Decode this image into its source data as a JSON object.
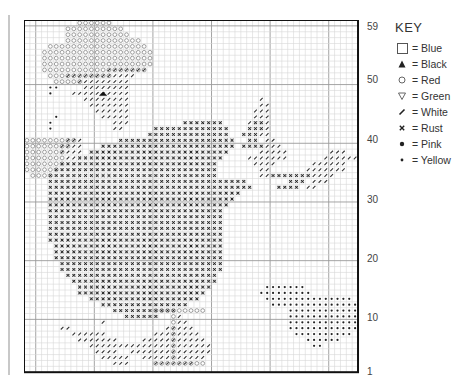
{
  "key": {
    "title": "KEY",
    "items": [
      {
        "symbol": "blue-square-icon",
        "sym": "square",
        "label": "= Blue"
      },
      {
        "symbol": "black-triangle-icon",
        "sym": "tri",
        "label": "= Black"
      },
      {
        "symbol": "red-circle-icon",
        "sym": "circle",
        "label": "= Red"
      },
      {
        "symbol": "green-down-triangle-icon",
        "sym": "vtri",
        "label": "= Green"
      },
      {
        "symbol": "white-slash-icon",
        "sym": "slash",
        "label": "= White"
      },
      {
        "symbol": "rust-x-icon",
        "sym": "x",
        "label": "= Rust"
      },
      {
        "symbol": "pink-dot-icon",
        "sym": "dot",
        "label": "= Pink"
      },
      {
        "symbol": "yellow-small-dot-icon",
        "sym": "sdot",
        "label": "= Yellow"
      }
    ]
  },
  "row_labels": [
    {
      "label": "59",
      "y": 27
    },
    {
      "label": "50",
      "y": 80
    },
    {
      "label": "40",
      "y": 140
    },
    {
      "label": "30",
      "y": 200
    },
    {
      "label": "20",
      "y": 259
    },
    {
      "label": "10",
      "y": 318
    },
    {
      "label": "1",
      "y": 372
    }
  ],
  "grid": {
    "cols": 57,
    "rows": 60,
    "cell_w": 5.86,
    "cell_h": 5.87,
    "major_every": 10,
    "major_offset_col": 2,
    "major_offset_row": 1
  },
  "chart_data": {
    "type": "table",
    "legend": [
      "Blue",
      "Black",
      "Red",
      "Green",
      "White",
      "Rust",
      "Pink",
      "Yellow"
    ],
    "row_range": [
      1,
      59
    ],
    "regions": {
      "red": [
        [
          0,
          9,
          14
        ],
        [
          1,
          7,
          16
        ],
        [
          2,
          7,
          17
        ],
        [
          3,
          7,
          19
        ],
        [
          4,
          4,
          20
        ],
        [
          5,
          3,
          21
        ],
        [
          6,
          3,
          21
        ],
        [
          7,
          3,
          21
        ],
        [
          8,
          3,
          20
        ],
        [
          9,
          4,
          14
        ],
        [
          10,
          5,
          9
        ],
        [
          20,
          0,
          8
        ],
        [
          21,
          0,
          7
        ],
        [
          22,
          0,
          6
        ],
        [
          23,
          0,
          6
        ],
        [
          24,
          0,
          6
        ],
        [
          25,
          0,
          5
        ],
        [
          26,
          1,
          4
        ]
      ],
      "white": [
        [
          8,
          14,
          20
        ],
        [
          9,
          7,
          18
        ],
        [
          10,
          9,
          17
        ],
        [
          11,
          10,
          17
        ],
        [
          12,
          8,
          17
        ],
        [
          13,
          10,
          17
        ],
        [
          14,
          11,
          17
        ],
        [
          15,
          12,
          17
        ],
        [
          16,
          13,
          17
        ],
        [
          17,
          15,
          17
        ],
        [
          18,
          15,
          16
        ],
        [
          13,
          40,
          40
        ],
        [
          14,
          40,
          41
        ],
        [
          15,
          39,
          41
        ],
        [
          16,
          39,
          41
        ],
        [
          17,
          38,
          41
        ],
        [
          18,
          38,
          41
        ],
        [
          19,
          38,
          41
        ],
        [
          20,
          41,
          42
        ],
        [
          21,
          41,
          43
        ],
        [
          22,
          40,
          44
        ],
        [
          23,
          38,
          44
        ],
        [
          24,
          39,
          42
        ],
        [
          25,
          40,
          41
        ],
        [
          26,
          40,
          41
        ],
        [
          22,
          52,
          54
        ],
        [
          23,
          51,
          56
        ],
        [
          24,
          49,
          54
        ],
        [
          25,
          48,
          54
        ],
        [
          26,
          48,
          52
        ],
        [
          27,
          49,
          51
        ],
        [
          28,
          48,
          49
        ],
        [
          20,
          7,
          9
        ],
        [
          21,
          6,
          9
        ],
        [
          22,
          6,
          9
        ],
        [
          23,
          7,
          9
        ],
        [
          24,
          8,
          9
        ],
        [
          25,
          8,
          10
        ],
        [
          26,
          7,
          10
        ],
        [
          27,
          7,
          11
        ],
        [
          28,
          8,
          12
        ]
      ],
      "rust": [
        [
          17,
          27,
          33
        ],
        [
          18,
          22,
          34
        ],
        [
          19,
          21,
          34
        ],
        [
          20,
          16,
          35
        ],
        [
          21,
          13,
          35
        ],
        [
          22,
          11,
          34
        ],
        [
          23,
          9,
          33
        ],
        [
          24,
          6,
          32
        ],
        [
          25,
          5,
          32
        ],
        [
          26,
          4,
          32
        ],
        [
          27,
          4,
          37
        ],
        [
          28,
          4,
          38
        ],
        [
          29,
          4,
          36
        ],
        [
          30,
          4,
          35
        ],
        [
          31,
          4,
          34
        ],
        [
          32,
          4,
          33
        ],
        [
          33,
          4,
          33
        ],
        [
          34,
          4,
          33
        ],
        [
          35,
          4,
          33
        ],
        [
          36,
          4,
          33
        ],
        [
          37,
          4,
          33
        ],
        [
          38,
          5,
          33
        ],
        [
          39,
          5,
          33
        ],
        [
          40,
          5,
          33
        ],
        [
          41,
          6,
          33
        ],
        [
          42,
          6,
          33
        ],
        [
          43,
          7,
          32
        ],
        [
          44,
          8,
          32
        ],
        [
          45,
          9,
          31
        ],
        [
          46,
          9,
          30
        ],
        [
          47,
          11,
          29
        ],
        [
          48,
          13,
          27
        ],
        [
          49,
          15,
          25
        ],
        [
          50,
          17,
          22
        ],
        [
          17,
          39,
          40
        ],
        [
          18,
          38,
          40
        ],
        [
          19,
          37,
          39
        ],
        [
          20,
          38,
          39
        ],
        [
          21,
          37,
          40
        ],
        [
          26,
          42,
          48
        ],
        [
          27,
          45,
          47
        ],
        [
          28,
          43,
          46
        ]
      ],
      "pink": [
        [
          45,
          41,
          47
        ],
        [
          46,
          40,
          48
        ],
        [
          47,
          41,
          55
        ],
        [
          48,
          42,
          56
        ],
        [
          49,
          45,
          56
        ],
        [
          50,
          45,
          56
        ],
        [
          51,
          45,
          56
        ],
        [
          52,
          45,
          56
        ],
        [
          53,
          46,
          55
        ],
        [
          54,
          48,
          53
        ],
        [
          55,
          49,
          50
        ]
      ],
      "white_bottom": [
        [
          51,
          26,
          27
        ],
        [
          52,
          24,
          28
        ],
        [
          53,
          22,
          29
        ],
        [
          54,
          20,
          30
        ],
        [
          55,
          18,
          31
        ],
        [
          56,
          18,
          31
        ],
        [
          57,
          20,
          30
        ],
        [
          58,
          22,
          28
        ],
        [
          52,
          6,
          7
        ],
        [
          53,
          8,
          9
        ],
        [
          54,
          9,
          12
        ],
        [
          55,
          11,
          13
        ],
        [
          56,
          12,
          15
        ],
        [
          57,
          13,
          17
        ],
        [
          58,
          15,
          17
        ],
        [
          53,
          10,
          13
        ],
        [
          54,
          13,
          15
        ],
        [
          55,
          14,
          17
        ],
        [
          51,
          13,
          13
        ],
        [
          50,
          26,
          26
        ]
      ]
    }
  }
}
